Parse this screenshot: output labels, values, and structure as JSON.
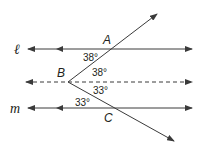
{
  "diagram": {
    "type": "geometry-parallel-lines",
    "colors": {
      "line": "#3a3a3a",
      "text": "#231f20",
      "background": "#ffffff"
    },
    "lines": [
      {
        "id": "l",
        "label": "ℓ",
        "style": "solid",
        "y": 49
      },
      {
        "id": "dashed",
        "label": "",
        "style": "dashed",
        "y": 82
      },
      {
        "id": "m",
        "label": "m",
        "style": "solid",
        "y": 108
      }
    ],
    "points": {
      "A": {
        "label": "A",
        "x": 112,
        "y": 49
      },
      "B": {
        "label": "B",
        "x": 68,
        "y": 82
      },
      "C": {
        "label": "C",
        "x": 115,
        "y": 108
      }
    },
    "angles": [
      {
        "id": "angle-l-A",
        "value": "38°",
        "location": "between line ℓ and ray BA at A"
      },
      {
        "id": "angle-AB-dashed",
        "value": "38°",
        "location": "between ray BA and dashed line at B"
      },
      {
        "id": "angle-dashed-BC",
        "value": "33°",
        "location": "between dashed line and ray BC at B"
      },
      {
        "id": "angle-m-C",
        "value": "33°",
        "location": "between line m and ray BC at C"
      }
    ]
  }
}
